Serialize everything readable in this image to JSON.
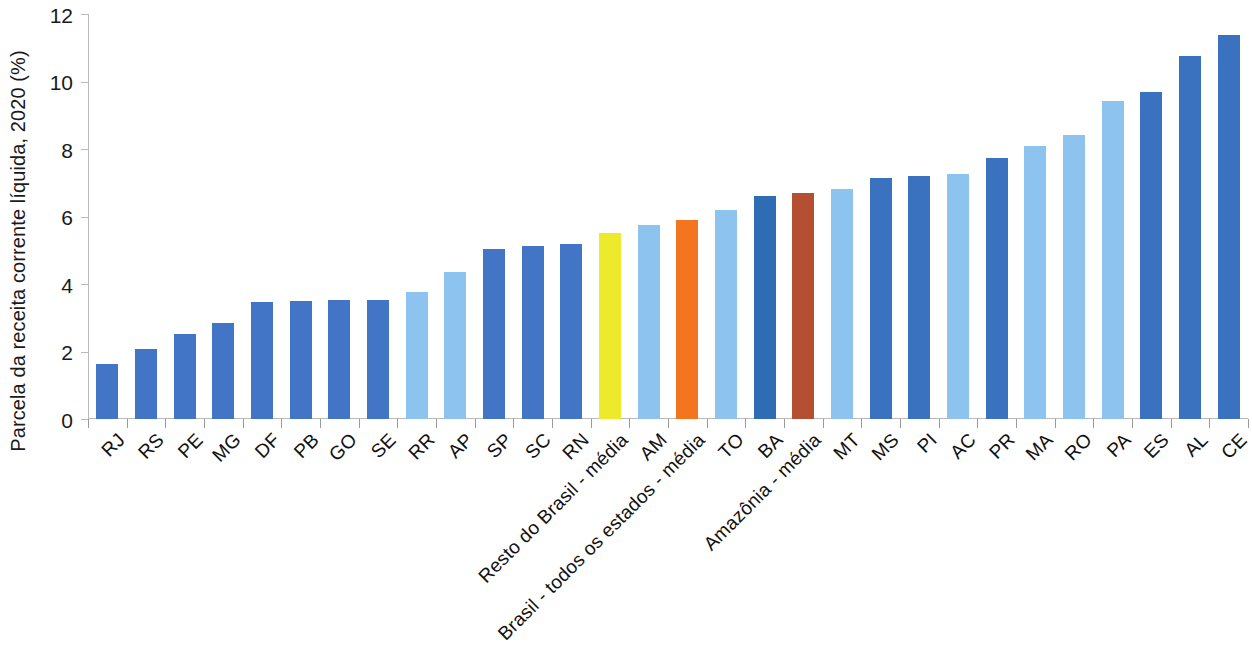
{
  "chart_data": {
    "type": "bar",
    "title": "",
    "subtitle": "",
    "xlabel": "",
    "ylabel": "Parcela da receita corrente líquida, 2020 (%)",
    "ylim": [
      0,
      12
    ],
    "ytick_values": [
      0,
      2,
      4,
      6,
      8,
      10,
      12
    ],
    "ytick_labels": [
      "0",
      "2",
      "4",
      "6",
      "8",
      "10",
      "12"
    ],
    "grid": false,
    "legend": "none",
    "categories": [
      "RJ",
      "RS",
      "PE",
      "MG",
      "DF",
      "PB",
      "GO",
      "SE",
      "RR",
      "AP",
      "SP",
      "SC",
      "RN",
      "Resto do Brasil - média",
      "AM",
      "Brasil - todos os estados - média",
      "TO",
      "BA",
      "Amazônia - média",
      "MT",
      "MS",
      "PI",
      "AC",
      "PR",
      "MA",
      "RO",
      "PA",
      "ES",
      "AL",
      "CE"
    ],
    "values": [
      1.63,
      2.07,
      2.53,
      2.84,
      3.47,
      3.51,
      3.52,
      3.54,
      3.75,
      4.37,
      5.03,
      5.12,
      5.18,
      5.5,
      5.76,
      5.9,
      6.2,
      6.6,
      6.7,
      6.83,
      7.15,
      7.21,
      7.27,
      7.73,
      8.1,
      8.41,
      9.42,
      9.7,
      10.75,
      11.38
    ],
    "colors": [
      "#4275c5",
      "#4275c5",
      "#4275c5",
      "#4275c5",
      "#4275c5",
      "#4275c5",
      "#4275c5",
      "#4275c5",
      "#8cc3ef",
      "#8cc3ef",
      "#4275c5",
      "#4275c5",
      "#4275c5",
      "#ede92b",
      "#8cc3ef",
      "#f4751f",
      "#8cc3ef",
      "#2e6db4",
      "#b44f32",
      "#8cc3ef",
      "#3a72bf",
      "#3a72bf",
      "#8cc3ef",
      "#3a72bf",
      "#8cc3ef",
      "#8cc3ef",
      "#8cc3ef",
      "#3a72bf",
      "#3a72bf",
      "#3a72bf"
    ],
    "palette": {
      "medium_blue": "#4275c5",
      "light_blue": "#8cc3ef",
      "dark_blue": "#2e6db4",
      "yellow": "#ede92b",
      "orange": "#f4751f",
      "brick_red": "#b44f32",
      "axis": "#b9b9b9",
      "text": "#111111"
    }
  }
}
